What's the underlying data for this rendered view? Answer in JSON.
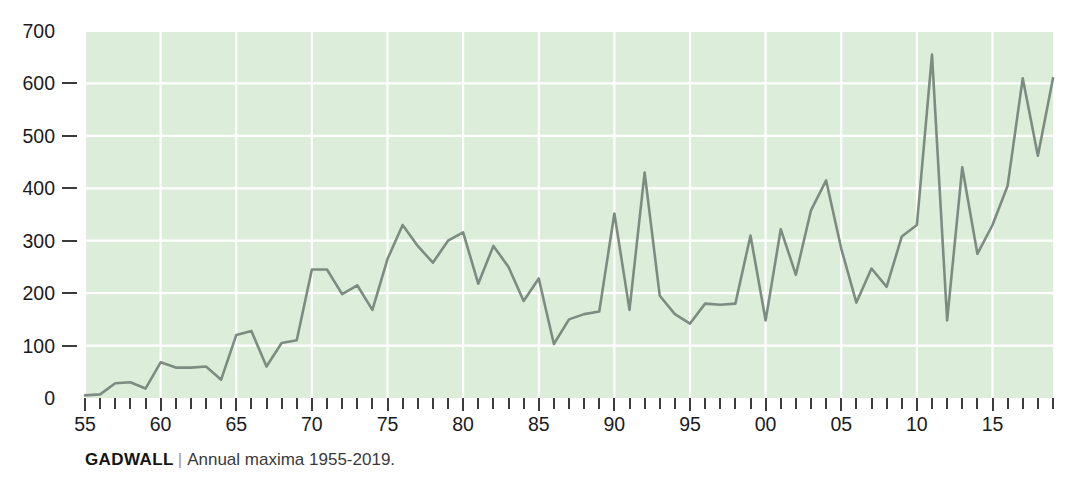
{
  "caption": {
    "species": "GADWALL",
    "separator": "|",
    "description": "Annual maxima 1955-2019."
  },
  "colors": {
    "plot_background": "#dcedda",
    "grid": "#ffffff",
    "line": "#7d8c80",
    "text": "#1b1b1b",
    "tick": "#3d3d3d",
    "page_background": "#ffffff"
  },
  "chart_data": {
    "type": "line",
    "xlabel": "",
    "ylabel": "",
    "xlim": [
      1955,
      2019
    ],
    "ylim": [
      0,
      700
    ],
    "grid": true,
    "legend": "none",
    "y_ticks": [
      0,
      100,
      200,
      300,
      400,
      500,
      600,
      700
    ],
    "y_tick_labels": [
      "0",
      "100",
      "200",
      "300",
      "400",
      "500",
      "600",
      "700"
    ],
    "x_tick_years": [
      1955,
      1960,
      1965,
      1970,
      1975,
      1980,
      1985,
      1990,
      1995,
      2000,
      2005,
      2010,
      2015
    ],
    "x_tick_labels": [
      "55",
      "60",
      "65",
      "70",
      "75",
      "80",
      "85",
      "90",
      "95",
      "00",
      "05",
      "10",
      "15"
    ],
    "x_minor_every": 1,
    "x": [
      1955,
      1956,
      1957,
      1958,
      1959,
      1960,
      1961,
      1962,
      1963,
      1964,
      1965,
      1966,
      1967,
      1968,
      1969,
      1970,
      1971,
      1972,
      1973,
      1974,
      1975,
      1976,
      1977,
      1978,
      1979,
      1980,
      1981,
      1982,
      1983,
      1984,
      1985,
      1986,
      1987,
      1988,
      1989,
      1990,
      1991,
      1992,
      1993,
      1994,
      1995,
      1996,
      1997,
      1998,
      1999,
      2000,
      2001,
      2002,
      2003,
      2004,
      2005,
      2006,
      2007,
      2008,
      2009,
      2010,
      2011,
      2012,
      2013,
      2014,
      2015,
      2016,
      2017,
      2018,
      2019
    ],
    "series": [
      {
        "name": "Annual maxima",
        "values": [
          5,
          7,
          28,
          30,
          18,
          68,
          58,
          58,
          60,
          35,
          120,
          128,
          60,
          105,
          110,
          245,
          245,
          198,
          215,
          168,
          265,
          330,
          290,
          258,
          300,
          316,
          218,
          290,
          250,
          185,
          228,
          103,
          150,
          160,
          165,
          352,
          168,
          430,
          195,
          160,
          142,
          180,
          178,
          180,
          310,
          148,
          322,
          235,
          358,
          415,
          285,
          182,
          247,
          212,
          308,
          330,
          655,
          148,
          440,
          275,
          330,
          405,
          610,
          462,
          610
        ]
      }
    ]
  }
}
